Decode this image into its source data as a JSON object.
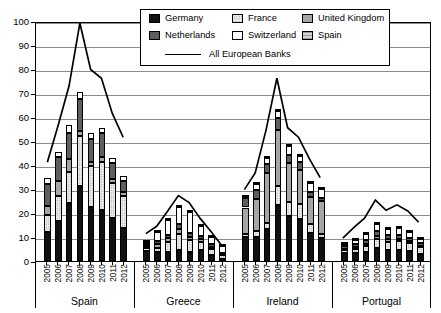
{
  "chart_data": {
    "type": "bar",
    "subtype": "stacked-bar-with-line-overlay",
    "title": "",
    "xlabel": "",
    "ylabel": "",
    "ylim": [
      0,
      100
    ],
    "ytick_labels": [
      "0",
      "10",
      "20",
      "30",
      "40",
      "50",
      "60",
      "70",
      "80",
      "90",
      "100"
    ],
    "yticks": [
      0,
      10,
      20,
      30,
      40,
      50,
      60,
      70,
      80,
      90,
      100
    ],
    "grid": true,
    "legend_position": "top-center-inside",
    "groups": [
      "Spain",
      "Greece",
      "Ireland",
      "Portugal"
    ],
    "categories": [
      "2005",
      "2006",
      "2007",
      "2008",
      "2009",
      "2010",
      "2011",
      "2012"
    ],
    "series": [
      {
        "name": "Germany",
        "fill": "solid-black",
        "color": "#111111",
        "values": {
          "Spain": [
            12.0,
            16.8,
            24.0,
            31.3,
            22.6,
            21.3,
            17.8,
            13.9
          ],
          "Greece": [
            4.0,
            3.6,
            3.7,
            4.6,
            3.7,
            4.5,
            2.3,
            0.8
          ],
          "Ireland": [
            10.2,
            10.0,
            13.4,
            23.2,
            18.8,
            17.5,
            11.8,
            9.5
          ],
          "Portugal": [
            3.4,
            3.3,
            3.9,
            5.3,
            4.6,
            4.5,
            4.0,
            3.0
          ]
        }
      },
      {
        "name": "France",
        "fill": "light-dotted",
        "color": "#e8e8e8",
        "values": {
          "Spain": [
            7.0,
            10.3,
            13.0,
            20.6,
            16.9,
            19.9,
            14.6,
            13.1
          ],
          "Greece": [
            1.4,
            2.0,
            4.1,
            6.7,
            5.0,
            3.3,
            2.6,
            1.6
          ],
          "Ireland": [
            1.1,
            2.5,
            2.3,
            8.2,
            5.8,
            6.1,
            3.5,
            1.8
          ],
          "Portugal": [
            1.2,
            1.6,
            2.2,
            3.8,
            3.4,
            3.7,
            3.4,
            2.7
          ]
        }
      },
      {
        "name": "United Kingdom",
        "fill": "medium-gray",
        "color": "#a6a6a6",
        "values": {
          "Spain": [
            4.1,
            6.2,
            5.5,
            2.3,
            1.8,
            2.3,
            1.8,
            1.7
          ],
          "Greece": [
            0.9,
            1.5,
            1.6,
            1.9,
            1.4,
            1.3,
            1.1,
            0.6
          ],
          "Ireland": [
            11.0,
            13.2,
            20.8,
            23.3,
            16.1,
            14.4,
            11.4,
            13.8
          ],
          "Portugal": [
            0.6,
            0.8,
            1.1,
            1.4,
            1.0,
            1.1,
            0.9,
            0.7
          ]
        }
      },
      {
        "name": "Netherlands",
        "fill": "dark-gray",
        "color": "#5e5e5e",
        "values": {
          "Spain": [
            8.8,
            10.0,
            11.0,
            13.1,
            9.6,
            9.9,
            6.7,
            4.6
          ],
          "Greece": [
            0.6,
            1.3,
            1.4,
            2.1,
            1.6,
            1.2,
            0.9,
            0.5
          ],
          "Ireland": [
            3.8,
            4.0,
            4.0,
            4.7,
            3.6,
            3.4,
            2.0,
            1.3
          ],
          "Portugal": [
            0.9,
            1.3,
            1.6,
            2.0,
            1.7,
            1.7,
            1.4,
            1.0
          ]
        }
      },
      {
        "name": "Switzerland",
        "fill": "white",
        "color": "#fdfdfd",
        "values": {
          "Spain": [
            2.5,
            2.2,
            3.3,
            3.1,
            2.3,
            2.2,
            2.1,
            2.1
          ],
          "Greece": [
            1.2,
            3.8,
            6.4,
            7.2,
            8.8,
            4.2,
            3.1,
            2.7
          ],
          "Ireland": [
            0.4,
            2.3,
            2.4,
            3.2,
            3.6,
            2.3,
            4.0,
            3.8
          ],
          "Portugal": [
            1.1,
            1.8,
            2.6,
            3.1,
            2.7,
            2.8,
            2.3,
            1.8
          ]
        }
      },
      {
        "name": "Spain",
        "fill": "light-hatched",
        "color": "#d4d4d4",
        "values": {
          "Spain": [
            0.0,
            0.0,
            0.0,
            0.0,
            0.0,
            0.0,
            0.0,
            0.0
          ],
          "Greece": [
            0.3,
            0.3,
            0.3,
            0.3,
            0.3,
            0.3,
            0.3,
            0.3
          ],
          "Ireland": [
            0.3,
            0.3,
            0.3,
            0.3,
            0.3,
            0.3,
            0.3,
            0.3
          ],
          "Portugal": [
            0.3,
            0.3,
            0.3,
            0.3,
            0.3,
            0.3,
            0.3,
            0.3
          ]
        }
      }
    ],
    "line_series": {
      "name": "All European Banks",
      "color": "#000000",
      "values": {
        "Spain": [
          41.5,
          57.0,
          73.5,
          100.0,
          80.5,
          76.8,
          62.0,
          52.0
        ],
        "Greece": [
          11.5,
          14.6,
          20.9,
          27.5,
          24.6,
          18.0,
          12.5,
          6.5
        ],
        "Ireland": [
          30.0,
          37.0,
          55.0,
          76.8,
          56.0,
          52.0,
          43.0,
          35.0
        ],
        "Portugal": [
          9.6,
          14.0,
          18.0,
          25.6,
          21.3,
          23.6,
          21.0,
          16.3
        ]
      }
    }
  },
  "legend": {
    "entries": [
      {
        "label": "Germany"
      },
      {
        "label": "France"
      },
      {
        "label": "United Kingdom"
      },
      {
        "label": "Netherlands"
      },
      {
        "label": "Switzerland"
      },
      {
        "label": "Spain"
      }
    ],
    "line_entry": {
      "label": "All European Banks"
    }
  }
}
